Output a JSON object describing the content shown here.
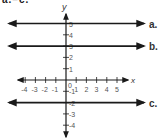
{
  "header": {
    "text": "a.–c."
  },
  "axes": {
    "x_label": "x",
    "y_label": "y",
    "origin_label": "0",
    "x_ticks": [
      {
        "value": -4,
        "label": "-4"
      },
      {
        "value": -3,
        "label": "-3"
      },
      {
        "value": -2,
        "label": "-2"
      },
      {
        "value": -1,
        "label": "-1"
      },
      {
        "value": 1,
        "label": "1"
      },
      {
        "value": 2,
        "label": "2"
      },
      {
        "value": 3,
        "label": "3"
      },
      {
        "value": 4,
        "label": "4"
      },
      {
        "value": 5,
        "label": "5"
      }
    ],
    "y_ticks": [
      {
        "value": 5,
        "label": "5"
      },
      {
        "value": 4,
        "label": "4"
      },
      {
        "value": 3,
        "label": "3"
      },
      {
        "value": 2,
        "label": "2"
      },
      {
        "value": 1,
        "label": "1"
      },
      {
        "value": -1,
        "label": "-1"
      },
      {
        "value": -2,
        "label": "-2"
      },
      {
        "value": -3,
        "label": "-3"
      },
      {
        "value": -4,
        "label": "-4"
      }
    ]
  },
  "lines": [
    {
      "id": "a",
      "label": "a.",
      "equation": "y = 5",
      "y": 5
    },
    {
      "id": "b",
      "label": "b.",
      "equation": "y = 3",
      "y": 3
    },
    {
      "id": "c",
      "label": "c.",
      "equation": "y = -2",
      "y": -2
    }
  ],
  "colors": {
    "line": "#1a1a1a",
    "text": "#333333",
    "tick_label": "#555555"
  }
}
